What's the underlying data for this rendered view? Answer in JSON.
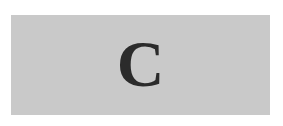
{
  "panel": {
    "label": "C",
    "background_color": "#c9c9c9",
    "text_color": "#2b2b2b"
  }
}
